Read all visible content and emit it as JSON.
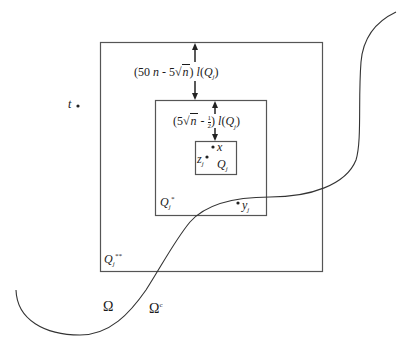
{
  "diagram": {
    "type": "nested-cubes-with-boundary",
    "boxes": {
      "outer": {
        "label": "Q",
        "sub": "j",
        "sup": "**"
      },
      "middle": {
        "label": "Q",
        "sub": "j",
        "sup": "*"
      },
      "inner": {
        "label": "Q",
        "sub": "j"
      }
    },
    "distances": {
      "outer_to_middle": {
        "prefix": "(50 ",
        "n": "n",
        "mid": " - 5",
        "sqrt_arg": "n",
        "suffix": ") ",
        "l": "l",
        "open": "(",
        "Q": "Q",
        "sub": "j",
        "close": ")"
      },
      "middle_to_inner": {
        "prefix": "(5",
        "sqrt_arg": "n",
        "mid": " - ",
        "frac_num": "1",
        "frac_den": "2",
        "suffix": ") ",
        "l": "l",
        "open": "(",
        "Q": "Q",
        "sub": "j",
        "close": ")"
      }
    },
    "points": {
      "t": {
        "label": "t"
      },
      "x": {
        "label": "x"
      },
      "z": {
        "label": "z",
        "sub": "j"
      },
      "y": {
        "label": "y",
        "sub": "j"
      }
    },
    "regions": {
      "omega": "Ω",
      "omega_c": "Ω",
      "omega_c_sup": "c"
    },
    "colors": {
      "stroke": "#444444",
      "text": "#1a1a1a"
    }
  }
}
